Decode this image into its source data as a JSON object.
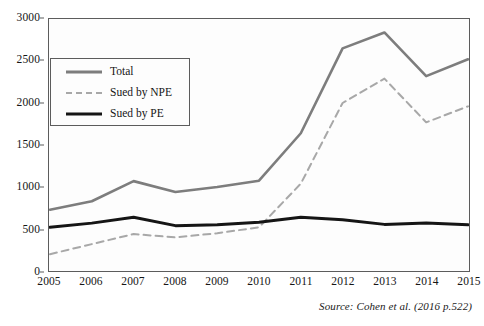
{
  "chart_data": {
    "type": "line",
    "title": "",
    "xlabel": "",
    "ylabel": "",
    "categories": [
      "2005",
      "2006",
      "2007",
      "2008",
      "2009",
      "2010",
      "2011",
      "2012",
      "2013",
      "2014",
      "2015"
    ],
    "x": [
      2005,
      2006,
      2007,
      2008,
      2009,
      2010,
      2011,
      2012,
      2013,
      2014,
      2015
    ],
    "ylim": [
      0,
      3000
    ],
    "xlim": [
      2005,
      2015
    ],
    "yticks": [
      0,
      500,
      1000,
      1500,
      2000,
      2500,
      3000
    ],
    "ytick_labels": [
      "0",
      "500",
      "1000",
      "1500",
      "2000",
      "2500",
      "3000"
    ],
    "grid": false,
    "legend_position": "upper-left-inside",
    "series": [
      {
        "name": "Total",
        "style": "solid",
        "color": "#7d7d7d",
        "width": 2.6,
        "values": [
          730,
          830,
          1070,
          940,
          1000,
          1075,
          1640,
          2650,
          2840,
          2320,
          2520
        ]
      },
      {
        "name": "Sued by NPE",
        "style": "dashed",
        "color": "#a8a8a8",
        "width": 2.0,
        "values": [
          200,
          320,
          440,
          400,
          450,
          520,
          1040,
          2000,
          2290,
          1770,
          1960
        ]
      },
      {
        "name": "Sued by PE",
        "style": "solid",
        "color": "#151515",
        "width": 3.0,
        "values": [
          520,
          570,
          640,
          540,
          550,
          580,
          640,
          610,
          555,
          570,
          550
        ]
      }
    ],
    "annotations": [
      {
        "name": "source",
        "text": "Source: Cohen et al. (2016 p.522)"
      }
    ]
  },
  "legend": {
    "items": [
      {
        "label": "Total"
      },
      {
        "label": "Sued by NPE"
      },
      {
        "label": "Sued by PE"
      }
    ]
  },
  "source": {
    "text": "Source: Cohen et al. (2016 p.522)"
  },
  "colors": {
    "total": "#7d7d7d",
    "sued_by_npe": "#a8a8a8",
    "sued_by_pe": "#151515",
    "axis": "#5c5c5c",
    "plot_background": "#fdfdfd",
    "page_background": "#ffffff"
  }
}
